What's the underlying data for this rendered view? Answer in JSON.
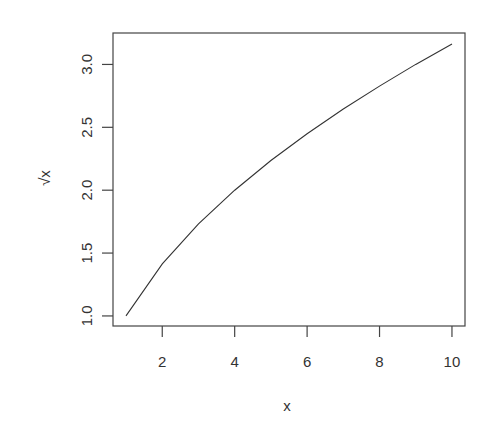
{
  "chart_data": {
    "type": "line",
    "title": "",
    "xlabel": "x",
    "ylabel": "√x",
    "x": [
      1,
      2,
      3,
      4,
      5,
      6,
      7,
      8,
      9,
      10
    ],
    "series": [
      {
        "name": "sqrt(x)",
        "values": [
          1.0,
          1.414,
          1.732,
          2.0,
          2.236,
          2.449,
          2.646,
          2.828,
          3.0,
          3.162
        ]
      }
    ],
    "xticks": [
      2,
      4,
      6,
      8,
      10
    ],
    "xtick_labels": [
      "2",
      "4",
      "6",
      "8",
      "10"
    ],
    "yticks": [
      1.0,
      1.5,
      2.0,
      2.5,
      3.0
    ],
    "ytick_labels": [
      "1.0",
      "1.5",
      "2.0",
      "2.5",
      "3.0"
    ],
    "xlim": [
      0.64,
      10.36
    ],
    "ylim": [
      0.92,
      3.25
    ],
    "grid": false,
    "legend": null,
    "line_color": "#333333",
    "axis_color": "#444444"
  }
}
